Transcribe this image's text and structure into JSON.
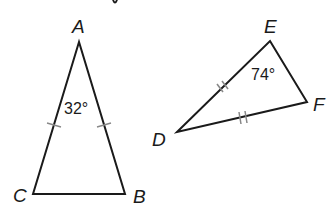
{
  "figure": {
    "triangle_abc": {
      "vertices": {
        "A": "A",
        "B": "B",
        "C": "C"
      },
      "apex_angle": "32°",
      "congruent_sides": [
        "AC",
        "AB"
      ],
      "tick_marks": 1
    },
    "triangle_def": {
      "vertices": {
        "D": "D",
        "E": "E",
        "F": "F"
      },
      "angle_e": "74°",
      "congruent_sides": [
        "DE",
        "DF"
      ],
      "tick_marks": 2
    },
    "colors": {
      "stroke": "#1a1a1a",
      "tick": "#888888",
      "background": "#ffffff"
    }
  }
}
